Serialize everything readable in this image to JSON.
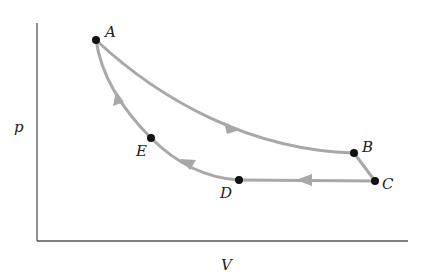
{
  "diagram": {
    "axes": {
      "y_label": "p",
      "x_label": "V",
      "color": "#555555"
    },
    "curve_color": "#a8a8a8",
    "point_color": "#111111",
    "points": [
      {
        "id": "A",
        "label": "A"
      },
      {
        "id": "B",
        "label": "B"
      },
      {
        "id": "C",
        "label": "C"
      },
      {
        "id": "D",
        "label": "D"
      },
      {
        "id": "E",
        "label": "E"
      }
    ],
    "paths": [
      {
        "from": "A",
        "to": "B",
        "shape": "curve",
        "direction": "A→B"
      },
      {
        "from": "B",
        "to": "C",
        "shape": "line",
        "direction": "B→C"
      },
      {
        "from": "C",
        "to": "D",
        "shape": "line",
        "direction": "C→D"
      },
      {
        "from": "D",
        "to": "E",
        "shape": "curve",
        "direction": "D→E"
      },
      {
        "from": "E",
        "to": "A",
        "shape": "curve",
        "direction": "E→A"
      }
    ]
  }
}
